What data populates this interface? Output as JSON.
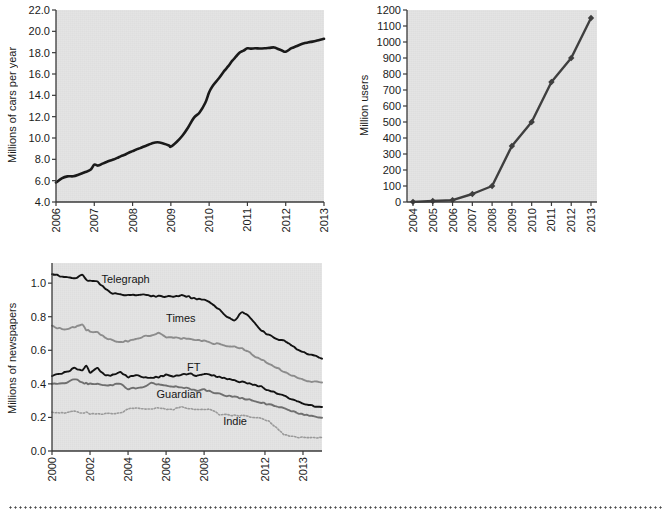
{
  "page": {
    "background_color": "#ffffff",
    "plot_background_color": "#e4e4e4",
    "divider": "dotted-rule"
  },
  "chart_data": [
    {
      "id": "cars",
      "type": "line",
      "title": "",
      "xlabel": "",
      "ylabel": "Millions of cars per year",
      "xlim": [
        2006,
        2013
      ],
      "ylim": [
        4.0,
        22.0
      ],
      "grid": false,
      "legend": "none",
      "line_color": "#1a1a1a",
      "xticks": [
        "2006",
        "2007",
        "2008",
        "2009",
        "2010",
        "2011",
        "2012",
        "2013"
      ],
      "yticks": [
        "4.0",
        "6.0",
        "8.0",
        "10.0",
        "12.0",
        "14.0",
        "16.0",
        "18.0",
        "20.0",
        "22.0"
      ],
      "x": [
        2006.0,
        2006.15,
        2006.3,
        2006.45,
        2006.6,
        2006.75,
        2006.9,
        2007.0,
        2007.1,
        2007.3,
        2007.5,
        2007.7,
        2007.9,
        2008.1,
        2008.3,
        2008.5,
        2008.65,
        2008.8,
        2008.95,
        2009.0,
        2009.15,
        2009.3,
        2009.45,
        2009.6,
        2009.75,
        2009.9,
        2010.0,
        2010.1,
        2010.25,
        2010.4,
        2010.6,
        2010.8,
        2011.0,
        2011.2,
        2011.45,
        2011.7,
        2011.9,
        2012.0,
        2012.15,
        2012.4,
        2012.6,
        2012.8,
        2013.0
      ],
      "y": [
        5.8,
        6.2,
        6.4,
        6.4,
        6.6,
        6.8,
        7.0,
        7.5,
        7.4,
        7.7,
        8.0,
        8.3,
        8.6,
        8.9,
        9.2,
        9.5,
        9.6,
        9.5,
        9.3,
        9.2,
        9.6,
        10.2,
        11.0,
        11.9,
        12.4,
        13.3,
        14.3,
        14.9,
        15.6,
        16.3,
        17.2,
        18.0,
        18.4,
        18.4,
        18.4,
        18.5,
        18.2,
        18.1,
        18.4,
        18.8,
        19.0,
        19.1,
        19.3
      ]
    },
    {
      "id": "users",
      "type": "line",
      "title": "",
      "xlabel": "",
      "ylabel": "Million users",
      "xlim": [
        2004,
        2013
      ],
      "ylim": [
        0,
        1200
      ],
      "grid": false,
      "legend": "none",
      "line_color": "#3f3f3f",
      "marker": "diamond",
      "xticks": [
        "2004",
        "2005",
        "2006",
        "2007",
        "2008",
        "2009",
        "2010",
        "2011",
        "2012",
        "2013"
      ],
      "yticks": [
        "0",
        "100",
        "200",
        "300",
        "400",
        "500",
        "600",
        "700",
        "800",
        "900",
        "1000",
        "1100",
        "1200"
      ],
      "x": [
        2004,
        2005,
        2006,
        2007,
        2008,
        2009,
        2010,
        2011,
        2012,
        2013
      ],
      "y": [
        1,
        6,
        12,
        50,
        100,
        350,
        500,
        750,
        900,
        1150
      ]
    },
    {
      "id": "newspapers",
      "type": "line",
      "title": "",
      "xlabel": "",
      "ylabel": "Millions of newspapers",
      "xlim": [
        2000,
        2014.2
      ],
      "ylim": [
        0.0,
        1.12
      ],
      "grid": false,
      "legend": "inline-labels",
      "xticks": [
        "2000",
        "2002",
        "2004",
        "2006",
        "2008",
        "2012",
        "2013"
      ],
      "yticks": [
        "0.0",
        "0.2",
        "0.4",
        "0.6",
        "0.8",
        "1.0"
      ],
      "x": [
        2000.0,
        2000.4,
        2000.8,
        2001.2,
        2001.6,
        2001.8,
        2002.0,
        2002.4,
        2002.8,
        2003.2,
        2003.6,
        2004.0,
        2004.4,
        2004.8,
        2005.2,
        2005.6,
        2006.0,
        2006.4,
        2006.8,
        2007.2,
        2007.6,
        2008.0,
        2008.4,
        2008.8,
        2009.2,
        2009.6,
        2010.0,
        2010.4,
        2010.7,
        2011.0,
        2011.4,
        2011.8,
        2012.2,
        2012.6,
        2013.0,
        2013.4,
        2013.8,
        2014.2
      ],
      "series": [
        {
          "name": "Telegraph",
          "color": "#121212",
          "style": "solid",
          "label_x": 2002.6,
          "label_y": 1.02,
          "values": [
            1.055,
            1.045,
            1.035,
            1.03,
            1.05,
            1.02,
            1.015,
            1.01,
            0.965,
            0.94,
            0.93,
            0.93,
            0.928,
            0.932,
            0.925,
            0.922,
            0.92,
            0.922,
            0.925,
            0.918,
            0.905,
            0.9,
            0.88,
            0.84,
            0.8,
            0.775,
            0.83,
            0.8,
            0.76,
            0.72,
            0.69,
            0.67,
            0.655,
            0.63,
            0.6,
            0.58,
            0.565,
            0.55
          ]
        },
        {
          "name": "Times",
          "color": "#8c8c8c",
          "style": "solid",
          "label_x": 2006.0,
          "label_y": 0.785,
          "values": [
            0.745,
            0.73,
            0.725,
            0.74,
            0.75,
            0.72,
            0.715,
            0.705,
            0.675,
            0.66,
            0.65,
            0.655,
            0.67,
            0.68,
            0.69,
            0.705,
            0.68,
            0.675,
            0.672,
            0.67,
            0.66,
            0.655,
            0.64,
            0.64,
            0.625,
            0.62,
            0.61,
            0.585,
            0.56,
            0.545,
            0.52,
            0.5,
            0.47,
            0.45,
            0.43,
            0.42,
            0.412,
            0.408
          ]
        },
        {
          "name": "FT",
          "color": "#121212",
          "style": "solid",
          "label_x": 2007.1,
          "label_y": 0.495,
          "values": [
            0.45,
            0.462,
            0.47,
            0.495,
            0.478,
            0.505,
            0.47,
            0.495,
            0.448,
            0.452,
            0.47,
            0.44,
            0.452,
            0.44,
            0.436,
            0.44,
            0.452,
            0.442,
            0.455,
            0.462,
            0.448,
            0.458,
            0.452,
            0.44,
            0.432,
            0.42,
            0.41,
            0.4,
            0.392,
            0.385,
            0.36,
            0.345,
            0.33,
            0.31,
            0.29,
            0.278,
            0.268,
            0.262
          ]
        },
        {
          "name": "Guardian",
          "color": "#6f6f6f",
          "style": "solid",
          "label_x": 2005.5,
          "label_y": 0.335,
          "values": [
            0.4,
            0.405,
            0.408,
            0.43,
            0.405,
            0.402,
            0.398,
            0.398,
            0.392,
            0.396,
            0.398,
            0.37,
            0.375,
            0.378,
            0.405,
            0.398,
            0.392,
            0.385,
            0.378,
            0.372,
            0.36,
            0.365,
            0.352,
            0.34,
            0.33,
            0.322,
            0.315,
            0.305,
            0.298,
            0.29,
            0.278,
            0.268,
            0.255,
            0.24,
            0.225,
            0.212,
            0.205,
            0.198
          ]
        },
        {
          "name": "Indie",
          "color": "#9a9a9a",
          "style": "dotted",
          "label_x": 2009.0,
          "label_y": 0.172,
          "values": [
            0.232,
            0.225,
            0.228,
            0.238,
            0.225,
            0.232,
            0.222,
            0.22,
            0.222,
            0.224,
            0.225,
            0.252,
            0.255,
            0.252,
            0.248,
            0.258,
            0.25,
            0.248,
            0.262,
            0.252,
            0.248,
            0.25,
            0.245,
            0.218,
            0.215,
            0.212,
            0.21,
            0.205,
            0.2,
            0.192,
            0.178,
            0.14,
            0.098,
            0.088,
            0.082,
            0.08,
            0.08,
            0.08
          ]
        }
      ]
    }
  ]
}
